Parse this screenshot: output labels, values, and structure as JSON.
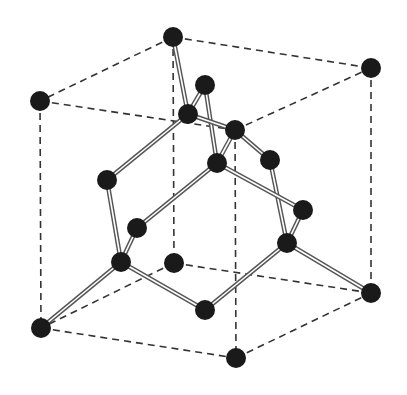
{
  "diagram": {
    "colors": {
      "atom": "#1a1a1a",
      "bond": "#555555",
      "bond_inner": "#ffffff",
      "cell_edge": "#333333",
      "background": "#ffffff"
    },
    "atoms": [
      {
        "id": "c_tbl",
        "x": 173,
        "y": 37
      },
      {
        "id": "c_tbr",
        "x": 371,
        "y": 68
      },
      {
        "id": "c_tfl",
        "x": 40,
        "y": 101
      },
      {
        "id": "f_top",
        "x": 235,
        "y": 130
      },
      {
        "id": "a1",
        "x": 205,
        "y": 85
      },
      {
        "id": "a2",
        "x": 188,
        "y": 114
      },
      {
        "id": "a3",
        "x": 217,
        "y": 163
      },
      {
        "id": "a4",
        "x": 270,
        "y": 160
      },
      {
        "id": "a5",
        "x": 107,
        "y": 180
      },
      {
        "id": "a6",
        "x": 303,
        "y": 210
      },
      {
        "id": "a7",
        "x": 137,
        "y": 228
      },
      {
        "id": "a8",
        "x": 287,
        "y": 243
      },
      {
        "id": "a9",
        "x": 121,
        "y": 262
      },
      {
        "id": "c_bbl",
        "x": 174,
        "y": 263
      },
      {
        "id": "c_bbr",
        "x": 371,
        "y": 293
      },
      {
        "id": "f_bot",
        "x": 205,
        "y": 310
      },
      {
        "id": "c_bfl",
        "x": 41,
        "y": 328
      },
      {
        "id": "c_bfr",
        "x": 236,
        "y": 358
      }
    ],
    "cell_edges": [
      [
        "c_tbl",
        "c_tbr"
      ],
      [
        "c_tbl",
        "c_tfl"
      ],
      [
        "c_tfl",
        "f_top"
      ],
      [
        "f_top",
        "c_tbr"
      ],
      [
        "c_bfl",
        "c_bfr"
      ],
      [
        "c_bfr",
        "c_bbr"
      ],
      [
        "c_bbl",
        "c_bbr"
      ],
      [
        "c_bbl",
        "c_bfl"
      ],
      [
        "c_tfl",
        "c_bfl"
      ],
      [
        "c_tbr",
        "c_bbr"
      ],
      [
        "c_tbl",
        "c_bbl"
      ],
      [
        "f_top",
        "c_bfr"
      ]
    ],
    "bonds": [
      [
        "c_tbl",
        "a2"
      ],
      [
        "a1",
        "a2"
      ],
      [
        "a1",
        "a3"
      ],
      [
        "a2",
        "a5"
      ],
      [
        "a2",
        "f_top"
      ],
      [
        "f_top",
        "a3"
      ],
      [
        "f_top",
        "a4"
      ],
      [
        "a4",
        "a8"
      ],
      [
        "a3",
        "a7"
      ],
      [
        "a3",
        "a6"
      ],
      [
        "a6",
        "a8"
      ],
      [
        "a5",
        "a9"
      ],
      [
        "a7",
        "a9"
      ],
      [
        "a9",
        "c_bfl"
      ],
      [
        "a9",
        "f_bot"
      ],
      [
        "f_bot",
        "a8"
      ],
      [
        "a8",
        "c_bbr"
      ]
    ]
  }
}
